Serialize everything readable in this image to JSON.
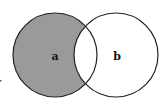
{
  "diagram": {
    "type": "venn",
    "sets": [
      {
        "id": "a",
        "label": "a",
        "cx": 55,
        "cy": 55,
        "r": 42,
        "shaded": true
      },
      {
        "id": "b",
        "label": "b",
        "cx": 116,
        "cy": 55,
        "r": 42,
        "shaded": false
      }
    ],
    "shaded_region": "a-only",
    "colors": {
      "shade": "#9a9a9a",
      "stroke": "#222222",
      "background": "#ffffff"
    }
  }
}
